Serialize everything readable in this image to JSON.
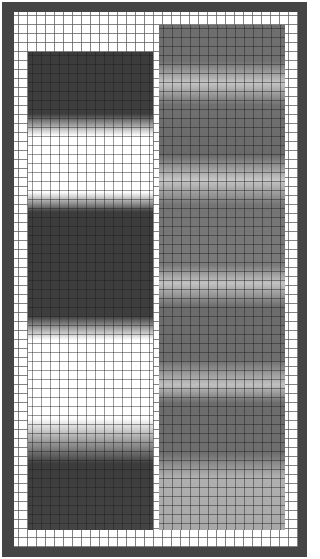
{
  "chart": {
    "frame_color": "#454545",
    "background_color": "#ffffff",
    "grid": {
      "cell_size_px": 9,
      "line_color": "#5a5a5a"
    },
    "columns": [
      {
        "id": "left",
        "x": 28,
        "y": 52,
        "width": 125,
        "height": 478,
        "base_color": "#ffffff",
        "stops": [
          {
            "y": 0,
            "color": "#3c3c3c"
          },
          {
            "y": 62,
            "color": "#3e3e3e"
          },
          {
            "y": 84,
            "color": "#ffffff"
          },
          {
            "y": 140,
            "color": "#ffffff"
          },
          {
            "y": 160,
            "color": "#3c3c3c"
          },
          {
            "y": 264,
            "color": "#3e3e3e"
          },
          {
            "y": 288,
            "color": "#ffffff"
          },
          {
            "y": 366,
            "color": "#ffffff"
          },
          {
            "y": 412,
            "color": "#3c3c3c"
          },
          {
            "y": 478,
            "color": "#444444"
          }
        ]
      },
      {
        "id": "right",
        "x": 159,
        "y": 25,
        "width": 126,
        "height": 505,
        "base_color": "#7a7a7a",
        "stops": [
          {
            "y": 0,
            "color": "#6e6e6e"
          },
          {
            "y": 36,
            "color": "#707070"
          },
          {
            "y": 58,
            "color": "#c4c4c4"
          },
          {
            "y": 80,
            "color": "#707070"
          },
          {
            "y": 130,
            "color": "#6a6a6a"
          },
          {
            "y": 155,
            "color": "#c6c6c6"
          },
          {
            "y": 180,
            "color": "#747474"
          },
          {
            "y": 240,
            "color": "#7a7a7a"
          },
          {
            "y": 258,
            "color": "#c2c2c2"
          },
          {
            "y": 282,
            "color": "#6c6c6c"
          },
          {
            "y": 335,
            "color": "#6e6e6e"
          },
          {
            "y": 360,
            "color": "#c0c0c0"
          },
          {
            "y": 378,
            "color": "#6c6c6c"
          },
          {
            "y": 428,
            "color": "#6e6e6e"
          },
          {
            "y": 452,
            "color": "#b0b0b0"
          },
          {
            "y": 505,
            "color": "#a8a8a8"
          }
        ]
      }
    ]
  }
}
